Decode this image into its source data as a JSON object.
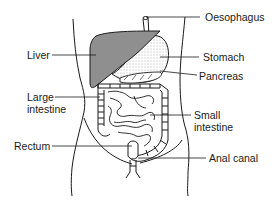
{
  "diagram": {
    "colors": {
      "ink": "#1a1a1a",
      "liver_fill": "#8f8f8f",
      "stomach_fill": "#f4f4f4",
      "background": "#ffffff"
    },
    "labels": {
      "oesophagus": "Oesophagus",
      "liver": "Liver",
      "stomach": "Stomach",
      "pancreas": "Pancreas",
      "large_intestine_1": "Large",
      "large_intestine_2": "intestine",
      "small_intestine_1": "Small",
      "small_intestine_2": "intestine",
      "rectum": "Rectum",
      "anal_canal": "Anal canal"
    }
  }
}
